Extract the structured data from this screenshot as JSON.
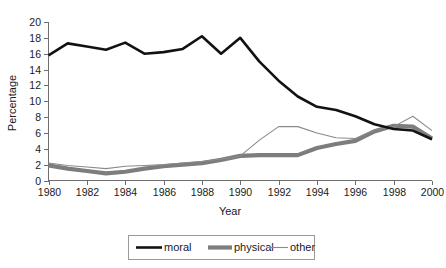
{
  "chart_data": {
    "type": "line",
    "title": "",
    "xlabel": "Year",
    "ylabel": "Percentage",
    "xlim": [
      1980,
      2000
    ],
    "ylim": [
      0,
      20
    ],
    "ytick_step": 2,
    "xtick_step": 2,
    "grid": false,
    "legend_position": "bottom-center",
    "x": [
      1980,
      1981,
      1982,
      1983,
      1984,
      1985,
      1986,
      1987,
      1988,
      1989,
      1990,
      1991,
      1992,
      1993,
      1994,
      1995,
      1996,
      1997,
      1998,
      1999,
      2000
    ],
    "xtick_labels": [
      "1980",
      "1982",
      "1984",
      "1986",
      "1988",
      "1990",
      "1992",
      "1994",
      "1996",
      "1998",
      "2000"
    ],
    "ytick_labels": [
      "0",
      "2",
      "4",
      "6",
      "8",
      "10",
      "12",
      "14",
      "16",
      "18",
      "20"
    ],
    "series": [
      {
        "name": "moral",
        "color": "#121212",
        "width": 2.6,
        "values": [
          15.8,
          17.3,
          16.9,
          16.5,
          17.4,
          16.0,
          16.2,
          16.6,
          18.2,
          16.0,
          18.0,
          15.0,
          12.6,
          10.6,
          9.3,
          8.9,
          8.1,
          7.1,
          6.5,
          6.3,
          5.2
        ]
      },
      {
        "name": "physical",
        "color": "#7d7d7d",
        "width": 4.2,
        "values": [
          1.9,
          1.5,
          1.2,
          0.9,
          1.1,
          1.5,
          1.8,
          2.0,
          2.2,
          2.6,
          3.1,
          3.2,
          3.2,
          3.2,
          4.1,
          4.6,
          5.0,
          6.2,
          6.9,
          6.8,
          5.3
        ]
      },
      {
        "name": "other",
        "color": "#8a8a8a",
        "width": 1.1,
        "values": [
          2.2,
          1.9,
          1.7,
          1.5,
          1.8,
          1.9,
          2.0,
          2.2,
          2.4,
          2.7,
          3.1,
          5.1,
          6.8,
          6.8,
          6.0,
          5.4,
          5.3,
          6.4,
          6.8,
          8.1,
          6.3
        ]
      }
    ]
  },
  "legend": {
    "items": [
      {
        "label": "moral"
      },
      {
        "label": "physical"
      },
      {
        "label": "other"
      }
    ]
  }
}
